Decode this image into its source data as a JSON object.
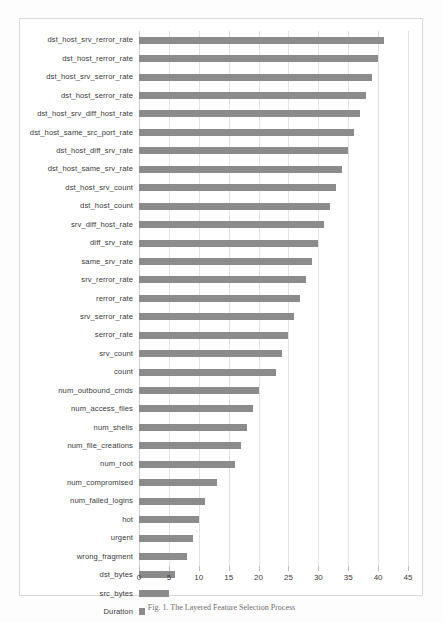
{
  "chart_data": {
    "type": "bar",
    "orientation": "horizontal",
    "title": "",
    "xlabel": "",
    "ylabel": "",
    "xlim": [
      0,
      45
    ],
    "xticks": [
      0,
      5,
      10,
      15,
      20,
      25,
      30,
      35,
      40,
      45
    ],
    "grid": true,
    "legend": false,
    "bar_color": "#8b8b8b",
    "categories": [
      "dst_host_srv_rerror_rate",
      "dst_host_rerror_rate",
      "dst_host_srv_serror_rate",
      "dst_host_serror_rate",
      "dst_host_srv_diff_host_rate",
      "dst_host_same_src_port_rate",
      "dst_host_diff_srv_rate",
      "dst_host_same_srv_rate",
      "dst_host_srv_count",
      "dst_host_count",
      "srv_diff_host_rate",
      "diff_srv_rate",
      "same_srv_rate",
      "srv_rerror_rate",
      "rerror_rate",
      "srv_serror_rate",
      "serror_rate",
      "srv_count",
      "count",
      "num_outbound_cmds",
      "num_access_files",
      "num_shells",
      "num_file_creations",
      "num_root",
      "num_compromised",
      "num_failed_logins",
      "hot",
      "urgent",
      "wrong_fragment",
      "dst_bytes",
      "src_bytes",
      "Duration"
    ],
    "values": [
      41,
      40,
      39,
      38,
      37,
      36,
      35,
      34,
      33,
      32,
      31,
      30,
      29,
      28,
      27,
      26,
      25,
      24,
      23,
      20,
      19,
      18,
      17,
      16,
      13,
      11,
      10,
      9,
      8,
      6,
      5,
      1
    ]
  },
  "caption": {
    "text": "Fig. 1.  The Layered Feature Selection Process"
  }
}
